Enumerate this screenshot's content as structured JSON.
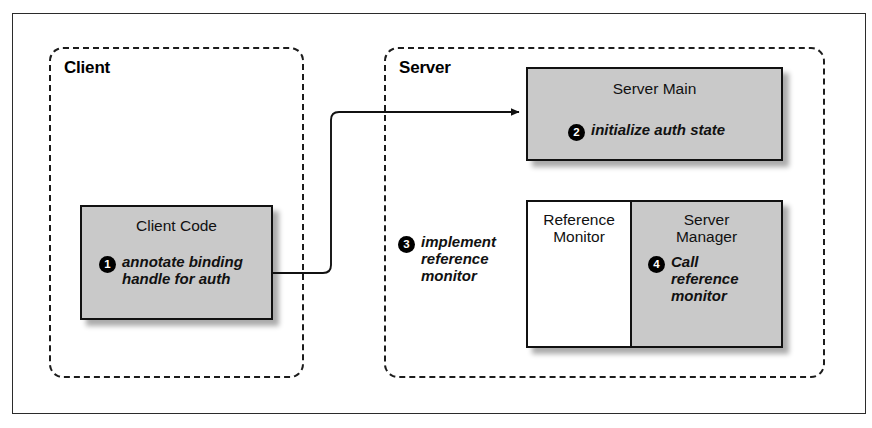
{
  "diagram": {
    "type": "architecture-flow",
    "zones": [
      {
        "id": "client",
        "label": "Client"
      },
      {
        "id": "server",
        "label": "Server"
      }
    ],
    "boxes": {
      "client_code": {
        "title": "Client Code",
        "step_number": "1",
        "step_text": "annotate binding\nhandle for auth"
      },
      "server_main": {
        "title": "Server Main",
        "step_number": "2",
        "step_text": "initialize auth state"
      },
      "reference_monitor": {
        "title": "Reference\nMonitor"
      },
      "server_manager": {
        "title": "Server\nManager",
        "step_number": "4",
        "step_text": "Call\nreference\nmonitor"
      }
    },
    "annotations": [
      {
        "id": "implement-reference-monitor",
        "step_number": "3",
        "step_text": "implement\nreference\nmonitor"
      }
    ],
    "connectors": [
      {
        "id": "client-code-to-server-main",
        "from": "client_code",
        "to": "server_main",
        "arrowhead": "to"
      }
    ],
    "colors": {
      "box_fill_gray": "#c9c9c9",
      "box_fill_white": "#ffffff",
      "stroke": "#111111",
      "bullet_fill": "#000000",
      "bullet_text": "#ffffff",
      "page_background": "#ffffff"
    }
  }
}
